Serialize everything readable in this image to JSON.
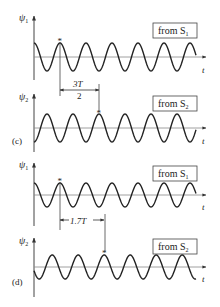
{
  "figure": {
    "panels": [
      {
        "id": "c",
        "label": "(c)",
        "offset_label_num": "3T",
        "offset_label_den": "2",
        "offset_periods": 1.5,
        "waves": [
          {
            "axis_label": "ψ1",
            "axis_sym": "ψ",
            "axis_sub": "1",
            "box_label": "from S",
            "box_sub": "1",
            "time_label": "t",
            "marker": "*"
          },
          {
            "axis_label": "ψ2",
            "axis_sym": "ψ",
            "axis_sub": "2",
            "box_label": "from S",
            "box_sub": "2",
            "time_label": "t",
            "marker": "*"
          }
        ]
      },
      {
        "id": "d",
        "label": "(d)",
        "offset_label": "1.7T",
        "offset_periods": 1.7,
        "waves": [
          {
            "axis_label": "ψ1",
            "axis_sym": "ψ",
            "axis_sub": "1",
            "box_label": "from S",
            "box_sub": "1",
            "time_label": "t",
            "marker": "*"
          },
          {
            "axis_label": "ψ2",
            "axis_sym": "ψ",
            "axis_sub": "2",
            "box_label": "from S",
            "box_sub": "2",
            "time_label": "t",
            "marker": "*"
          }
        ]
      }
    ],
    "colors": {
      "ink": "#222222",
      "axis": "#555555",
      "background": "#ffffff"
    }
  }
}
